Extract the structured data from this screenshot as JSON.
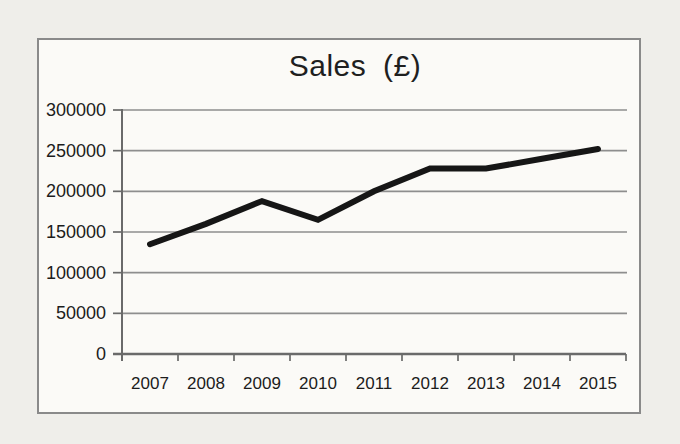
{
  "chart_data": {
    "type": "line",
    "title": "Sales (£)",
    "categories": [
      "2007",
      "2008",
      "2009",
      "2010",
      "2011",
      "2012",
      "2013",
      "2014",
      "2015"
    ],
    "values": [
      135000,
      160000,
      188000,
      165000,
      200000,
      228000,
      228000,
      240000,
      252000
    ],
    "series": [
      {
        "name": "Sales",
        "values": [
          135000,
          160000,
          188000,
          165000,
          200000,
          228000,
          228000,
          240000,
          252000
        ]
      }
    ],
    "xlabel": "",
    "ylabel": "",
    "ylim": [
      0,
      300000
    ],
    "yticks": [
      0,
      50000,
      100000,
      150000,
      200000,
      250000,
      300000
    ],
    "grid": true,
    "legend": "none",
    "line_color": "#161616",
    "gridline_color": "#8e8e8e",
    "axis_color": "#6a6a6a",
    "text_color": "#1c1c1c",
    "frame_border_color": "#8a8a8a",
    "chart_bg_color": "#fbfaf7",
    "page_bg_color": "#efeeea"
  }
}
